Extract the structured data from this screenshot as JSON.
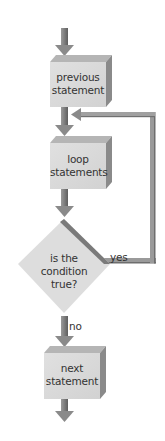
{
  "diagram": {
    "type": "flowchart",
    "title": "",
    "nodes": [
      {
        "id": "previous",
        "shape": "box-3d",
        "line1": "previous",
        "line2": "statement"
      },
      {
        "id": "loop",
        "shape": "box-3d",
        "line1": "loop",
        "line2": "statements"
      },
      {
        "id": "condition",
        "shape": "diamond",
        "line1": "is the",
        "line2": "condition",
        "line3": "true?"
      },
      {
        "id": "next",
        "shape": "box-3d",
        "line1": "next",
        "line2": "statement"
      }
    ],
    "edges": [
      {
        "from": "start",
        "to": "previous",
        "label": ""
      },
      {
        "from": "previous",
        "to": "loop",
        "label": ""
      },
      {
        "from": "loop",
        "to": "condition",
        "label": ""
      },
      {
        "from": "condition",
        "to": "loop",
        "label": "yes"
      },
      {
        "from": "condition",
        "to": "next",
        "label": "no"
      },
      {
        "from": "next",
        "to": "end",
        "label": ""
      }
    ],
    "edge_labels": {
      "yes": "yes",
      "no": "no"
    },
    "colors": {
      "box_face": "#d9d9d9",
      "box_top": "#b8b8b8",
      "box_side": "#8c8c8c",
      "arrow": "#8a8a8a",
      "arrow_dark": "#6e6e6e",
      "diamond": "#dcdcdc",
      "diamond_edge": "#7a7a7a",
      "loop_line": "#8f8f8f",
      "text": "#333333"
    }
  }
}
